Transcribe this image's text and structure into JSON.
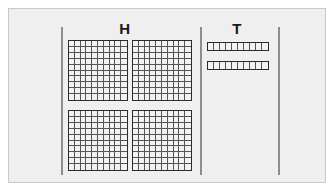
{
  "figure": {
    "type": "place-value-base-ten-blocks",
    "background_color": "#efefef",
    "frame_border_color": "#c9c9c9"
  },
  "columns": [
    {
      "id": "hundreds",
      "header_label": "H",
      "block_type": "hundred-flat",
      "block_count": 4,
      "cells_per_block": 100,
      "block_rows": 10,
      "block_cols": 10,
      "arrangement": "2x2",
      "value": 400
    },
    {
      "id": "tens",
      "header_label": "T",
      "block_type": "ten-rod",
      "block_count": 2,
      "cells_per_block": 10,
      "block_rows": 1,
      "block_cols": 10,
      "arrangement": "stacked",
      "value": 20
    }
  ],
  "dividers": [
    {
      "id": "left",
      "color": "#8d8d8d"
    },
    {
      "id": "middle",
      "color": "#8d8d8d"
    },
    {
      "id": "right",
      "color": "#8d8d8d"
    }
  ],
  "colors": {
    "block_outline": "#2b2b2b",
    "cell_line": "#555555",
    "cell_fill": "#f2f2f2",
    "header_text": "#1a1a1a"
  },
  "total_value": 420
}
